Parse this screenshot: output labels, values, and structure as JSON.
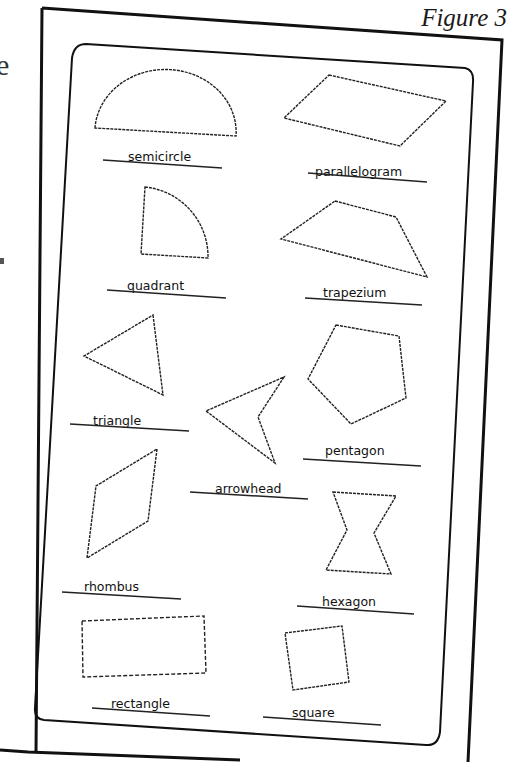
{
  "figure": {
    "title": "Figure 3",
    "edge_text": "e"
  },
  "shapes": [
    {
      "name": "semicircle",
      "label": "semicircle"
    },
    {
      "name": "parallelogram",
      "label": "parallelogram"
    },
    {
      "name": "quadrant",
      "label": "quadrant"
    },
    {
      "name": "trapezium",
      "label": "trapezium"
    },
    {
      "name": "triangle",
      "label": "triangle"
    },
    {
      "name": "pentagon",
      "label": "pentagon"
    },
    {
      "name": "arrowhead",
      "label": "arrowhead"
    },
    {
      "name": "rhombus",
      "label": "rhombus"
    },
    {
      "name": "hexagon",
      "label": "hexagon"
    },
    {
      "name": "rectangle",
      "label": "rectangle"
    },
    {
      "name": "square",
      "label": "square"
    }
  ]
}
